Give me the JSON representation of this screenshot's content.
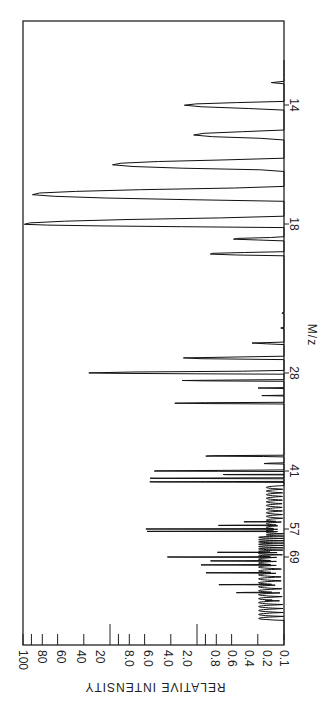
{
  "chart_data": {
    "type": "line",
    "subtype": "mass-spectrum (rotated 90°, log intensity scale)",
    "orientation": "rotated: m/z axis runs vertically (increasing downward), intensity axis horizontal (increasing leftward)",
    "title": "",
    "xlabel": "M/z",
    "ylabel": "RELATIVE INTENSITY",
    "yscale": "log",
    "ylim": [
      0.1,
      100
    ],
    "intensity_ticks": [
      "100",
      "80",
      "60",
      "40",
      "20",
      "8.0",
      "6.0",
      "4.0",
      "2.0",
      "0.8",
      "0.6",
      "0.4",
      "0.2",
      "0.1"
    ],
    "intensity_major_ticks": [
      100,
      10,
      1,
      0.1
    ],
    "mz_tick_labels": [
      "14",
      "18",
      "28",
      "41",
      "57",
      "69"
    ],
    "grid": false,
    "legend": null,
    "peaks": [
      {
        "mz": 13,
        "intensity": 0.14
      },
      {
        "mz": 14,
        "intensity": 1.4
      },
      {
        "mz": 15,
        "intensity": 1.1
      },
      {
        "mz": 16,
        "intensity": 9.5
      },
      {
        "mz": 17,
        "intensity": 80
      },
      {
        "mz": 18,
        "intensity": 100
      },
      {
        "mz": 19,
        "intensity": 0.4
      },
      {
        "mz": 20,
        "intensity": 0.75
      },
      {
        "mz": 22,
        "intensity": 0.12
      },
      {
        "mz": 24,
        "intensity": 0.12
      },
      {
        "mz": 25,
        "intensity": 0.12
      },
      {
        "mz": 26,
        "intensity": 0.25
      },
      {
        "mz": 27,
        "intensity": 1.5
      },
      {
        "mz": 28,
        "intensity": 18
      },
      {
        "mz": 29,
        "intensity": 1.5
      },
      {
        "mz": 30,
        "intensity": 0.2
      },
      {
        "mz": 31,
        "intensity": 0.18
      },
      {
        "mz": 32,
        "intensity": 1.8
      },
      {
        "mz": 39,
        "intensity": 0.9
      },
      {
        "mz": 40,
        "intensity": 0.2
      },
      {
        "mz": 41,
        "intensity": 3.8
      },
      {
        "mz": 42,
        "intensity": 0.6
      },
      {
        "mz": 43,
        "intensity": 4.0
      },
      {
        "mz": 44,
        "intensity": 3.9
      },
      {
        "mz": 55,
        "intensity": 0.3
      },
      {
        "mz": 56,
        "intensity": 0.6
      },
      {
        "mz": 57,
        "intensity": 4.2
      },
      {
        "mz": 58,
        "intensity": 4.2
      },
      {
        "mz": 67,
        "intensity": 0.6
      },
      {
        "mz": 69,
        "intensity": 2.2
      },
      {
        "mz": 70,
        "intensity": 0.7
      },
      {
        "mz": 71,
        "intensity": 0.9
      },
      {
        "mz": 73,
        "intensity": 0.8
      },
      {
        "mz": 76,
        "intensity": 0.6
      },
      {
        "mz": 78,
        "intensity": 0.4
      },
      {
        "mz": 80,
        "intensity": 0.2
      },
      {
        "mz": 85,
        "intensity": 0.12
      }
    ]
  },
  "labels": {
    "x_axis_title": "M/z",
    "y_axis_title": "RELATIVE INTENSITY",
    "mz_14": "14",
    "mz_18": "18",
    "mz_28": "28",
    "mz_41": "41",
    "mz_57": "57",
    "mz_69": "69",
    "tick_100": "100",
    "tick_80": "80",
    "tick_60": "60",
    "tick_40": "40",
    "tick_20": "20",
    "tick_8": "8.0",
    "tick_6": "6.0",
    "tick_4": "4.0",
    "tick_2": "2.0",
    "tick_08": "0.8",
    "tick_06": "0.6",
    "tick_04": "0.4",
    "tick_02": "0.2",
    "tick_01": "0.1"
  },
  "colors": {
    "line": "#111111",
    "frame": "#222222",
    "background": "#ffffff"
  }
}
